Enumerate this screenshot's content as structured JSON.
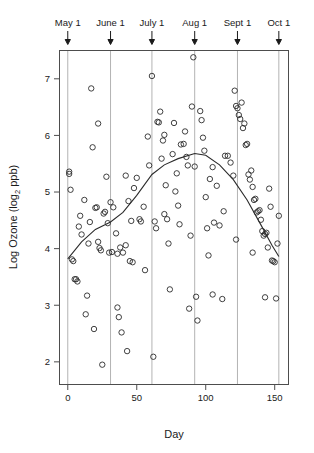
{
  "chart_data": {
    "type": "scatter",
    "title": "",
    "xlabel": "Day",
    "ylabel": "Log Ozone (log2 ppb)",
    "ylabel_main": "Log Ozone (log",
    "ylabel_sub": "2",
    "ylabel_tail": " ppb)",
    "xlim": [
      -6,
      160
    ],
    "ylim": [
      1.6,
      7.5
    ],
    "grid": true,
    "legend": null,
    "x_ticks": [
      0,
      50,
      100,
      150
    ],
    "x_tick_labels": [
      "0",
      "50",
      "100",
      "150"
    ],
    "y_ticks": [
      2,
      3,
      4,
      5,
      6,
      7
    ],
    "y_tick_labels": [
      "2",
      "3",
      "4",
      "5",
      "6",
      "7"
    ],
    "top_axis_label_title": "Month markers",
    "top_markers": [
      {
        "label": "May 1",
        "day": 0
      },
      {
        "label": "June 1",
        "day": 31
      },
      {
        "label": "July 1",
        "day": 61
      },
      {
        "label": "Aug 1",
        "day": 92
      },
      {
        "label": "Sept 1",
        "day": 123
      },
      {
        "label": "Oct 1",
        "day": 153
      }
    ],
    "marker_style": "open-circle",
    "points": [
      {
        "x": 1,
        "y": 5.36
      },
      {
        "x": 1,
        "y": 5.32
      },
      {
        "x": 2,
        "y": 5.04
      },
      {
        "x": 3,
        "y": 3.81
      },
      {
        "x": 4,
        "y": 3.78
      },
      {
        "x": 5,
        "y": 3.46
      },
      {
        "x": 6,
        "y": 3.46
      },
      {
        "x": 7,
        "y": 3.42
      },
      {
        "x": 8,
        "y": 4.39
      },
      {
        "x": 9,
        "y": 4.58
      },
      {
        "x": 10,
        "y": 4.25
      },
      {
        "x": 12,
        "y": 4.86
      },
      {
        "x": 13,
        "y": 2.84
      },
      {
        "x": 14,
        "y": 3.17
      },
      {
        "x": 15,
        "y": 4.09
      },
      {
        "x": 16,
        "y": 4.47
      },
      {
        "x": 17,
        "y": 6.83
      },
      {
        "x": 18,
        "y": 5.79
      },
      {
        "x": 19,
        "y": 2.58
      },
      {
        "x": 20,
        "y": 4.72
      },
      {
        "x": 21,
        "y": 4.73
      },
      {
        "x": 22,
        "y": 4.12
      },
      {
        "x": 23,
        "y": 4.01
      },
      {
        "x": 24,
        "y": 3.97
      },
      {
        "x": 25,
        "y": 1.95
      },
      {
        "x": 26,
        "y": 4.62
      },
      {
        "x": 27,
        "y": 4.65
      },
      {
        "x": 28,
        "y": 5.27
      },
      {
        "x": 29,
        "y": 4.45
      },
      {
        "x": 30,
        "y": 3.93
      },
      {
        "x": 31,
        "y": 4.82
      },
      {
        "x": 32,
        "y": 3.94
      },
      {
        "x": 33,
        "y": 4.73
      },
      {
        "x": 35,
        "y": 4.27
      },
      {
        "x": 36,
        "y": 3.91
      },
      {
        "x": 38,
        "y": 4.02
      },
      {
        "x": 40,
        "y": 3.93
      },
      {
        "x": 42,
        "y": 4.06
      },
      {
        "x": 44,
        "y": 4.84
      },
      {
        "x": 46,
        "y": 4.49
      },
      {
        "x": 48,
        "y": 5.07
      },
      {
        "x": 50,
        "y": 5.25
      },
      {
        "x": 52,
        "y": 4.52
      },
      {
        "x": 53,
        "y": 4.48
      },
      {
        "x": 55,
        "y": 4.74
      },
      {
        "x": 56,
        "y": 3.62
      },
      {
        "x": 58,
        "y": 5.98
      },
      {
        "x": 59,
        "y": 5.47
      },
      {
        "x": 61,
        "y": 7.05
      },
      {
        "x": 62,
        "y": 2.09
      },
      {
        "x": 63,
        "y": 4.48
      },
      {
        "x": 64,
        "y": 4.36
      },
      {
        "x": 65,
        "y": 6.24
      },
      {
        "x": 66,
        "y": 6.23
      },
      {
        "x": 67,
        "y": 6.42
      },
      {
        "x": 68,
        "y": 5.59
      },
      {
        "x": 69,
        "y": 5.91
      },
      {
        "x": 70,
        "y": 6.01
      },
      {
        "x": 71,
        "y": 5.12
      },
      {
        "x": 72,
        "y": 4.52
      },
      {
        "x": 73,
        "y": 4.09
      },
      {
        "x": 74,
        "y": 3.28
      },
      {
        "x": 76,
        "y": 5.67
      },
      {
        "x": 77,
        "y": 6.22
      },
      {
        "x": 78,
        "y": 5.01
      },
      {
        "x": 79,
        "y": 5.33
      },
      {
        "x": 80,
        "y": 4.76
      },
      {
        "x": 81,
        "y": 4.43
      },
      {
        "x": 82,
        "y": 5.84
      },
      {
        "x": 84,
        "y": 5.85
      },
      {
        "x": 85,
        "y": 6.07
      },
      {
        "x": 86,
        "y": 5.62
      },
      {
        "x": 87,
        "y": 5.47
      },
      {
        "x": 88,
        "y": 2.94
      },
      {
        "x": 89,
        "y": 4.23
      },
      {
        "x": 90,
        "y": 6.51
      },
      {
        "x": 91,
        "y": 7.38
      },
      {
        "x": 92,
        "y": 5.45
      },
      {
        "x": 93,
        "y": 3.15
      },
      {
        "x": 94,
        "y": 2.73
      },
      {
        "x": 96,
        "y": 6.43
      },
      {
        "x": 97,
        "y": 6.27
      },
      {
        "x": 98,
        "y": 5.96
      },
      {
        "x": 99,
        "y": 5.73
      },
      {
        "x": 100,
        "y": 4.91
      },
      {
        "x": 101,
        "y": 4.36
      },
      {
        "x": 102,
        "y": 3.88
      },
      {
        "x": 103,
        "y": 5.23
      },
      {
        "x": 105,
        "y": 5.44
      },
      {
        "x": 106,
        "y": 4.46
      },
      {
        "x": 108,
        "y": 5.11
      },
      {
        "x": 110,
        "y": 4.41
      },
      {
        "x": 112,
        "y": 3.11
      },
      {
        "x": 114,
        "y": 5.64
      },
      {
        "x": 116,
        "y": 5.64
      },
      {
        "x": 118,
        "y": 5.52
      },
      {
        "x": 120,
        "y": 5.29
      },
      {
        "x": 121,
        "y": 6.79
      },
      {
        "x": 122,
        "y": 6.52
      },
      {
        "x": 123,
        "y": 6.48
      },
      {
        "x": 124,
        "y": 6.36
      },
      {
        "x": 125,
        "y": 6.29
      },
      {
        "x": 126,
        "y": 6.58
      },
      {
        "x": 127,
        "y": 6.13
      },
      {
        "x": 128,
        "y": 6.21
      },
      {
        "x": 129,
        "y": 5.83
      },
      {
        "x": 130,
        "y": 5.85
      },
      {
        "x": 131,
        "y": 5.31
      },
      {
        "x": 132,
        "y": 5.22
      },
      {
        "x": 133,
        "y": 5.38
      },
      {
        "x": 134,
        "y": 5.09
      },
      {
        "x": 135,
        "y": 4.86
      },
      {
        "x": 136,
        "y": 4.88
      },
      {
        "x": 137,
        "y": 4.64
      },
      {
        "x": 138,
        "y": 4.66
      },
      {
        "x": 139,
        "y": 4.68
      },
      {
        "x": 140,
        "y": 4.51
      },
      {
        "x": 141,
        "y": 4.31
      },
      {
        "x": 142,
        "y": 4.23
      },
      {
        "x": 143,
        "y": 4.26
      },
      {
        "x": 144,
        "y": 4.28
      },
      {
        "x": 145,
        "y": 4.02
      },
      {
        "x": 146,
        "y": 5.06
      },
      {
        "x": 147,
        "y": 4.74
      },
      {
        "x": 148,
        "y": 3.79
      },
      {
        "x": 149,
        "y": 3.78
      },
      {
        "x": 150,
        "y": 3.76
      },
      {
        "x": 151,
        "y": 3.12
      },
      {
        "x": 152,
        "y": 4.09
      },
      {
        "x": 153,
        "y": 4.58
      },
      {
        "x": 36,
        "y": 2.96
      },
      {
        "x": 37,
        "y": 2.79
      },
      {
        "x": 39,
        "y": 2.52
      },
      {
        "x": 43,
        "y": 2.19
      },
      {
        "x": 45,
        "y": 3.78
      },
      {
        "x": 47,
        "y": 3.76
      },
      {
        "x": 105,
        "y": 3.19
      },
      {
        "x": 143,
        "y": 3.14
      },
      {
        "x": 22,
        "y": 6.21
      },
      {
        "x": 42,
        "y": 5.29
      },
      {
        "x": 70,
        "y": 4.61
      },
      {
        "x": 113,
        "y": 4.66
      },
      {
        "x": 122,
        "y": 4.16
      },
      {
        "x": 134,
        "y": 3.93
      }
    ],
    "smoother": {
      "name": "loess-smoother",
      "visible": true,
      "points": [
        {
          "x": 0,
          "y": 3.82
        },
        {
          "x": 10,
          "y": 4.12
        },
        {
          "x": 20,
          "y": 4.34
        },
        {
          "x": 31,
          "y": 4.47
        },
        {
          "x": 40,
          "y": 4.64
        },
        {
          "x": 50,
          "y": 4.94
        },
        {
          "x": 61,
          "y": 5.31
        },
        {
          "x": 70,
          "y": 5.48
        },
        {
          "x": 80,
          "y": 5.59
        },
        {
          "x": 92,
          "y": 5.68
        },
        {
          "x": 100,
          "y": 5.65
        },
        {
          "x": 110,
          "y": 5.48
        },
        {
          "x": 120,
          "y": 5.22
        },
        {
          "x": 130,
          "y": 4.86
        },
        {
          "x": 140,
          "y": 4.42
        },
        {
          "x": 148,
          "y": 4.06
        },
        {
          "x": 153,
          "y": 3.86
        }
      ]
    }
  }
}
